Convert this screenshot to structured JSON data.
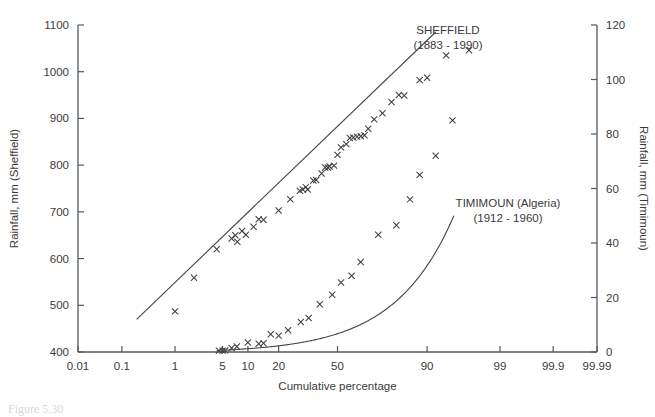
{
  "figure": {
    "caption": "Figure 5.30",
    "background": "#ffffff",
    "ink_color": "#3a3a3a"
  },
  "chart_data": {
    "type": "scatter",
    "title": "",
    "xlabel": "Cumulative percentage",
    "ylabel": "Rainfall, mm (Sheffield)",
    "y2label": "Rainfall, mm (Timimoun)",
    "grid": false,
    "legend_position": "inline-annotation",
    "x_scale": "probability",
    "x_ticks": [
      0.01,
      0.1,
      1,
      5,
      10,
      20,
      50,
      90,
      99,
      99.9,
      99.99
    ],
    "x_tick_labels": [
      "0.01",
      "0.1",
      "1",
      "5",
      "10",
      "20",
      "50",
      "90",
      "99",
      "99.9",
      "99.99"
    ],
    "xlim": [
      0.01,
      99.99
    ],
    "y_ticks": [
      400,
      500,
      600,
      700,
      800,
      900,
      1000,
      1100
    ],
    "y_tick_labels": [
      "400",
      "500",
      "600",
      "700",
      "800",
      "900",
      "1000",
      "1100"
    ],
    "ylim": [
      400,
      1100
    ],
    "y2_ticks": [
      0,
      20,
      40,
      60,
      80,
      100,
      120
    ],
    "y2_tick_labels": [
      "0",
      "20",
      "40",
      "60",
      "80",
      "100",
      "120"
    ],
    "y2lim": [
      0,
      120
    ],
    "annotations": [
      {
        "name": "sheffield-label",
        "line1": "SHEFFIELD",
        "line2": "(1883 - 1990)",
        "x": 448,
        "y": 34
      },
      {
        "name": "timimoun-label",
        "line1": "TIMIMOUN (Algeria)",
        "line2": "(1912 - 1960)",
        "x": 508,
        "y": 207
      }
    ],
    "series": [
      {
        "name": "SHEFFIELD",
        "period": "1883 - 1990",
        "axis": "left",
        "marker": "x",
        "fit": "straight-line",
        "fit_endpoints": [
          [
            0.2,
            470
          ],
          [
            92.0,
            1085
          ]
        ],
        "points": [
          [
            1.0,
            487
          ],
          [
            2.0,
            559
          ],
          [
            4.2,
            620
          ],
          [
            6.5,
            643
          ],
          [
            7.2,
            650
          ],
          [
            7.6,
            636
          ],
          [
            8.6,
            659
          ],
          [
            9.5,
            651
          ],
          [
            11.5,
            668
          ],
          [
            13.0,
            684
          ],
          [
            14.5,
            683
          ],
          [
            20.0,
            703
          ],
          [
            25.0,
            727
          ],
          [
            29.5,
            745
          ],
          [
            31.0,
            748
          ],
          [
            32.5,
            753
          ],
          [
            33.5,
            748
          ],
          [
            36.5,
            767
          ],
          [
            38.0,
            768
          ],
          [
            41.0,
            782
          ],
          [
            43.0,
            795
          ],
          [
            44.5,
            795
          ],
          [
            45.5,
            797
          ],
          [
            48.0,
            799
          ],
          [
            50.0,
            822
          ],
          [
            52.0,
            838
          ],
          [
            55.0,
            845
          ],
          [
            57.0,
            858
          ],
          [
            59.0,
            859
          ],
          [
            61.0,
            861
          ],
          [
            63.0,
            862
          ],
          [
            65.0,
            864
          ],
          [
            67.0,
            878
          ],
          [
            70.0,
            898
          ],
          [
            74.0,
            911
          ],
          [
            78.0,
            935
          ],
          [
            81.0,
            950
          ],
          [
            83.0,
            949
          ],
          [
            88.0,
            982
          ],
          [
            90.0,
            987
          ],
          [
            94.0,
            1035
          ],
          [
            97.0,
            1046
          ]
        ]
      },
      {
        "name": "TIMIMOUN (Algeria)",
        "period": "1912 - 1960",
        "axis": "right",
        "marker": "x",
        "fit": "curve",
        "points": [
          [
            4.5,
            0.5
          ],
          [
            5.0,
            0.5
          ],
          [
            5.4,
            0.6
          ],
          [
            6.5,
            1.5
          ],
          [
            7.5,
            2.0
          ],
          [
            10.0,
            3.5
          ],
          [
            13.0,
            3.0
          ],
          [
            14.5,
            3.2
          ],
          [
            17.0,
            6.5
          ],
          [
            20.0,
            6.0
          ],
          [
            24.0,
            8.0
          ],
          [
            30.0,
            11.0
          ],
          [
            34.0,
            12.5
          ],
          [
            40.0,
            17.5
          ],
          [
            47.0,
            21.0
          ],
          [
            52.0,
            25.5
          ],
          [
            58.0,
            28.0
          ],
          [
            63.0,
            33.0
          ],
          [
            72.0,
            43.0
          ],
          [
            80.0,
            46.5
          ],
          [
            85.0,
            56.0
          ],
          [
            88.0,
            65.0
          ],
          [
            92.0,
            72.0
          ],
          [
            95.0,
            85.0
          ]
        ]
      }
    ]
  }
}
